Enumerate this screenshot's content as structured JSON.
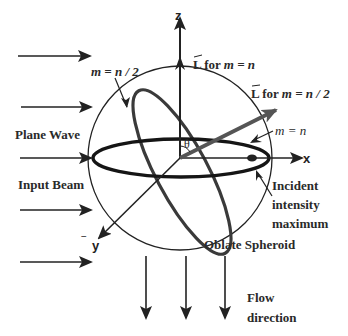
{
  "diagram": {
    "axes": {
      "z": "z",
      "x": "x",
      "y": "y",
      "y_prefix": "−",
      "angle": "θ"
    },
    "labels": {
      "ring_m_half": "m = n / 2",
      "L_m_n": "L̃ for m = n",
      "L_m_n_prefix": "L",
      "L_m_n_text": " for ",
      "L_m_n_eq": "m = n",
      "L_m_half_prefix": "L",
      "L_m_half_text": " for ",
      "L_m_half_eq": "m = n / 2",
      "ring_m_n": "m = n",
      "plane_wave": "Plane Wave",
      "input_beam": "Input Beam",
      "incident_line1": "Incident",
      "incident_line2": "intensity",
      "incident_line3": "maximum",
      "oblate_spheroid": "Oblate Spheroid",
      "flow_line1": "Flow",
      "flow_line2": "direction"
    },
    "input_arrows_count": 5,
    "flow_arrows_count": 3,
    "colors": {
      "ink": "#222222",
      "ring_tilted": "#3a3a3a",
      "L_half_arrow": "#555555"
    }
  }
}
